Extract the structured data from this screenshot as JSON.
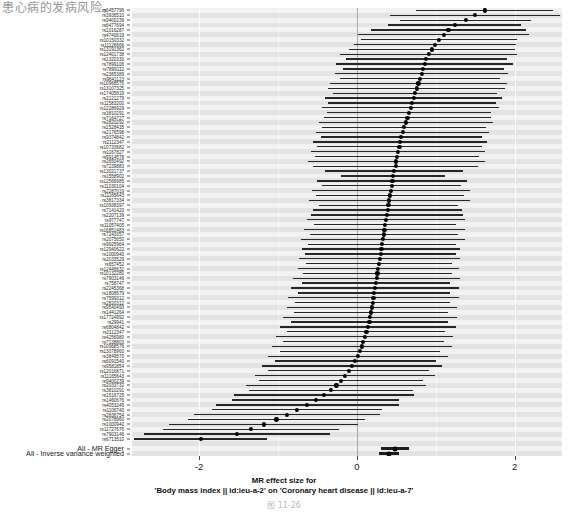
{
  "page": {
    "book_text": "患心病的发病风险。",
    "caption": "图 11-26"
  },
  "figure": {
    "xaxis": {
      "title_line1": "MR effect size for",
      "title_line2": "'Body mass index || id:ieu-a-2' on 'Coronary heart disease || id:ieu-a-7'",
      "ticks": [
        -2,
        0,
        2
      ],
      "tick_labels": [
        "-2",
        "0",
        "2"
      ],
      "min": -2.85,
      "max": 2.6
    },
    "colors": {
      "point": "#000000",
      "interval": "#262626",
      "panel_bg": "#eaeaea",
      "band_light": "#f2f2f2",
      "band_dark": "#e3e3e3",
      "gridline": "#ffffff",
      "zeroline": "#9a9a9a"
    },
    "summary_labels": {
      "mr_egger": "All - MR Egger",
      "ivw": "All - Inverse variance weighted"
    }
  },
  "chart_data": {
    "type": "forest",
    "title": "MR effect size for 'Body mass index || id:ieu-a-2' on 'Coronary heart disease || id:ieu-a-7'",
    "xlabel": "MR effect size",
    "ylabel": "SNP",
    "xlim": [
      -2.85,
      2.6
    ],
    "grid": true,
    "legend": "none",
    "xticks": [
      -2,
      0,
      2
    ],
    "reference_line": 0,
    "snps": [
      {
        "label": "rs6457796",
        "b": 1.62,
        "lo": 0.75,
        "hi": 2.49
      },
      {
        "label": "rs3936510",
        "b": 1.5,
        "lo": 0.42,
        "hi": 2.58
      },
      {
        "label": "rs9400239",
        "b": 1.38,
        "lo": 0.55,
        "hi": 2.21
      },
      {
        "label": "rs6477694",
        "b": 1.24,
        "lo": 0.4,
        "hi": 2.08
      },
      {
        "label": "rs1016287",
        "b": 1.16,
        "lo": 0.18,
        "hi": 2.14
      },
      {
        "label": "rs4740619",
        "b": 1.1,
        "lo": 0.02,
        "hi": 2.18
      },
      {
        "label": "rs10150332",
        "b": 1.04,
        "lo": 0.05,
        "hi": 2.03
      },
      {
        "label": "rs11126666",
        "b": 0.99,
        "lo": -0.04,
        "hi": 2.02
      },
      {
        "label": "rs13191362",
        "b": 0.95,
        "lo": -0.1,
        "hi": 2.0
      },
      {
        "label": "rs12401738",
        "b": 0.91,
        "lo": -0.21,
        "hi": 2.03
      },
      {
        "label": "rs1320330",
        "b": 0.88,
        "lo": -0.14,
        "hi": 1.9
      },
      {
        "label": "rs7899106",
        "b": 0.86,
        "lo": -0.26,
        "hi": 1.98
      },
      {
        "label": "rs7899112",
        "b": 0.84,
        "lo": -0.18,
        "hi": 1.86
      },
      {
        "label": "rs2365389",
        "b": 0.82,
        "lo": -0.28,
        "hi": 1.92
      },
      {
        "label": "rs9641123",
        "b": 0.8,
        "lo": -0.22,
        "hi": 1.82
      },
      {
        "label": "rs10968576",
        "b": 0.78,
        "lo": -0.34,
        "hi": 1.9
      },
      {
        "label": "rs13107325",
        "b": 0.76,
        "lo": -0.36,
        "hi": 1.88
      },
      {
        "label": "rs17405819",
        "b": 0.74,
        "lo": -0.3,
        "hi": 1.78
      },
      {
        "label": "rs2121279",
        "b": 0.72,
        "lo": -0.4,
        "hi": 1.84
      },
      {
        "label": "rs11583200",
        "b": 0.7,
        "lo": -0.36,
        "hi": 1.76
      },
      {
        "label": "rs12286929",
        "b": 0.68,
        "lo": -0.44,
        "hi": 1.8
      },
      {
        "label": "rs3810291",
        "b": 0.66,
        "lo": -0.38,
        "hi": 1.7
      },
      {
        "label": "rs7164727",
        "b": 0.64,
        "lo": -0.42,
        "hi": 1.7
      },
      {
        "label": "rs2820292",
        "b": 0.62,
        "lo": -0.48,
        "hi": 1.72
      },
      {
        "label": "rs1528435",
        "b": 0.6,
        "lo": -0.44,
        "hi": 1.64
      },
      {
        "label": "rs2176598",
        "b": 0.58,
        "lo": -0.52,
        "hi": 1.68
      },
      {
        "label": "rs9374842",
        "b": 0.56,
        "lo": -0.46,
        "hi": 1.58
      },
      {
        "label": "rs2112347",
        "b": 0.55,
        "lo": -0.55,
        "hi": 1.65
      },
      {
        "label": "rs10733682",
        "b": 0.54,
        "lo": -0.5,
        "hi": 1.58
      },
      {
        "label": "rs1167827",
        "b": 0.52,
        "lo": -0.58,
        "hi": 1.62
      },
      {
        "label": "rs9914578",
        "b": 0.51,
        "lo": -0.53,
        "hi": 1.55
      },
      {
        "label": "rs2650492",
        "b": 0.5,
        "lo": -0.62,
        "hi": 1.62
      },
      {
        "label": "rs7239883",
        "b": 0.49,
        "lo": -0.55,
        "hi": 1.53
      },
      {
        "label": "rs13021737",
        "b": 0.47,
        "lo": -0.41,
        "hi": 1.35
      },
      {
        "label": "rs1558902",
        "b": 0.46,
        "lo": -0.2,
        "hi": 1.12
      },
      {
        "label": "rs12566985",
        "b": 0.45,
        "lo": -0.5,
        "hi": 1.4
      },
      {
        "label": "rs11030104",
        "b": 0.44,
        "lo": -0.44,
        "hi": 1.32
      },
      {
        "label": "rs2287019",
        "b": 0.43,
        "lo": -0.57,
        "hi": 1.43
      },
      {
        "label": "rs11165643",
        "b": 0.42,
        "lo": -0.52,
        "hi": 1.36
      },
      {
        "label": "rs3817334",
        "b": 0.41,
        "lo": -0.61,
        "hi": 1.43
      },
      {
        "label": "rs10938397",
        "b": 0.4,
        "lo": -0.48,
        "hi": 1.28
      },
      {
        "label": "rs7141420",
        "b": 0.39,
        "lo": -0.55,
        "hi": 1.33
      },
      {
        "label": "rs2207139",
        "b": 0.38,
        "lo": -0.58,
        "hi": 1.34
      },
      {
        "label": "rs977747",
        "b": 0.37,
        "lo": -0.63,
        "hi": 1.37
      },
      {
        "label": "rs11057405",
        "b": 0.36,
        "lo": -0.54,
        "hi": 1.26
      },
      {
        "label": "rs16851483",
        "b": 0.35,
        "lo": -0.67,
        "hi": 1.37
      },
      {
        "label": "rs7243357",
        "b": 0.34,
        "lo": -0.6,
        "hi": 1.28
      },
      {
        "label": "rs2075650",
        "b": 0.33,
        "lo": -0.71,
        "hi": 1.37
      },
      {
        "label": "rs9925964",
        "b": 0.32,
        "lo": -0.62,
        "hi": 1.26
      },
      {
        "label": "rs12940622",
        "b": 0.31,
        "lo": -0.69,
        "hi": 1.31
      },
      {
        "label": "rs1000940",
        "b": 0.3,
        "lo": -0.66,
        "hi": 1.26
      },
      {
        "label": "rs2033529",
        "b": 0.29,
        "lo": -0.73,
        "hi": 1.31
      },
      {
        "label": "rs657452",
        "b": 0.28,
        "lo": -0.64,
        "hi": 1.2
      },
      {
        "label": "rs12446632",
        "b": 0.27,
        "lo": -0.75,
        "hi": 1.29
      },
      {
        "label": "rs10132280",
        "b": 0.26,
        "lo": -0.68,
        "hi": 1.2
      },
      {
        "label": "rs7903146",
        "b": 0.25,
        "lo": -0.81,
        "hi": 1.31
      },
      {
        "label": "rs758747",
        "b": 0.24,
        "lo": -0.7,
        "hi": 1.18
      },
      {
        "label": "rs2245368",
        "b": 0.23,
        "lo": -0.83,
        "hi": 1.29
      },
      {
        "label": "rs1808579",
        "b": 0.22,
        "lo": -0.74,
        "hi": 1.18
      },
      {
        "label": "rs7599312",
        "b": 0.21,
        "lo": -0.87,
        "hi": 1.29
      },
      {
        "label": "rs2820312",
        "b": 0.2,
        "lo": -0.78,
        "hi": 1.18
      },
      {
        "label": "rs9540493",
        "b": 0.19,
        "lo": -0.89,
        "hi": 1.27
      },
      {
        "label": "rs1441264",
        "b": 0.18,
        "lo": -0.8,
        "hi": 1.16
      },
      {
        "label": "rs17724992",
        "b": 0.17,
        "lo": -0.93,
        "hi": 1.27
      },
      {
        "label": "rs29941",
        "b": 0.16,
        "lo": -0.84,
        "hi": 1.16
      },
      {
        "label": "rs6804842",
        "b": 0.14,
        "lo": -0.98,
        "hi": 1.26
      },
      {
        "label": "rs2112347",
        "b": 0.12,
        "lo": -0.88,
        "hi": 1.12
      },
      {
        "label": "rs4256980",
        "b": 0.1,
        "lo": -1.02,
        "hi": 1.22
      },
      {
        "label": "rs7138803",
        "b": 0.08,
        "lo": -0.94,
        "hi": 1.1
      },
      {
        "label": "rs10968576",
        "b": 0.06,
        "lo": -1.08,
        "hi": 1.2
      },
      {
        "label": "rs13078960",
        "b": 0.04,
        "lo": -0.98,
        "hi": 1.06
      },
      {
        "label": "rs3849570",
        "b": 0.01,
        "lo": -1.13,
        "hi": 1.15
      },
      {
        "label": "rs6091540",
        "b": -0.02,
        "lo": -1.04,
        "hi": 1.0
      },
      {
        "label": "rs9581854",
        "b": -0.06,
        "lo": -1.2,
        "hi": 1.08
      },
      {
        "label": "rs12016871",
        "b": -0.1,
        "lo": -1.12,
        "hi": 0.92
      },
      {
        "label": "rs11165643",
        "b": -0.15,
        "lo": -1.29,
        "hi": 0.99
      },
      {
        "label": "rs9400239",
        "b": -0.2,
        "lo": -1.24,
        "hi": 0.84
      },
      {
        "label": "rs2033732",
        "b": -0.26,
        "lo": -1.4,
        "hi": 0.88
      },
      {
        "label": "rs3810291",
        "b": -0.33,
        "lo": -1.37,
        "hi": 0.71
      },
      {
        "label": "rs1516725",
        "b": -0.42,
        "lo": -1.56,
        "hi": 0.72
      },
      {
        "label": "rs1460676",
        "b": -0.52,
        "lo": -1.58,
        "hi": 0.54
      },
      {
        "label": "rs4053245",
        "b": -0.63,
        "lo": -1.79,
        "hi": 0.53
      },
      {
        "label": "rs1106740",
        "b": -0.76,
        "lo": -1.84,
        "hi": 0.32
      },
      {
        "label": "rs2836754",
        "b": -0.89,
        "lo": -2.07,
        "hi": 0.29
      },
      {
        "label": "rs2078960",
        "b": -1.02,
        "lo": -2.14,
        "hi": 0.1
      },
      {
        "label": "rs1000940",
        "b": -1.18,
        "lo": -2.38,
        "hi": 0.02
      },
      {
        "label": "rs11727676",
        "b": -1.34,
        "lo": -2.46,
        "hi": -0.22
      },
      {
        "label": "rs7903146",
        "b": -1.52,
        "lo": -2.7,
        "hi": -0.34
      },
      {
        "label": "rs6713510",
        "b": -1.98,
        "lo": -2.82,
        "hi": -1.14
      }
    ],
    "summary": [
      {
        "label": "All - MR Egger",
        "b": 0.48,
        "lo": 0.3,
        "hi": 0.66
      },
      {
        "label": "All - Inverse variance weighted",
        "b": 0.41,
        "lo": 0.28,
        "hi": 0.54
      }
    ]
  }
}
